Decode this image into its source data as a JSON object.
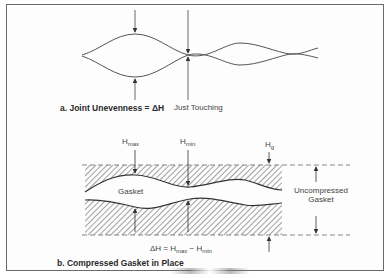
{
  "figure": {
    "part_a": {
      "caption": "a. Joint Unevenness = ΔH",
      "annotation": "Just Touching"
    },
    "part_b": {
      "caption": "b. Compressed Gasket in Place",
      "labels": {
        "h_max": {
          "base": "H",
          "sub": "max"
        },
        "h_min": {
          "base": "H",
          "sub": "min"
        },
        "h_g": {
          "base": "H",
          "sub": "g"
        },
        "gasket": "Gasket",
        "uncompressed_line1": "Uncompressed",
        "uncompressed_line2": "Gasket"
      },
      "formula": {
        "lhs": "ΔH = H",
        "sub1": "max",
        "mid": " − H",
        "sub2": "min"
      }
    },
    "colors": {
      "line": "#555555",
      "hatch": "#777777",
      "frame": "#6a6a6a"
    }
  }
}
